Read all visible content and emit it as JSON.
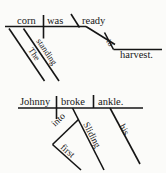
{
  "figure": {
    "kind": "sentence-diagram-pair",
    "style": "Reed-Kellogg",
    "ink_color": "#181818",
    "background_color": "#fbfbf9",
    "line_color": "#151515"
  },
  "diagrams": [
    {
      "id": "diagram-1",
      "sentence": "The standing corn was ready to harvest.",
      "labels": {
        "subject": "corn",
        "verb": "was",
        "predicate_adjective": "ready",
        "subject_modifier_1": "The",
        "subject_modifier_2": "standing",
        "infinitive_preposition": "to",
        "infinitive_object": "harvest."
      }
    },
    {
      "id": "diagram-2",
      "sentence": "Sliding into first Johnny broke his ankle.",
      "labels": {
        "subject": "Johnny",
        "verb": "broke",
        "direct_object": "ankle.",
        "participle": "Sliding",
        "preposition": "into",
        "prep_object": "first",
        "object_modifier": "his"
      }
    }
  ]
}
